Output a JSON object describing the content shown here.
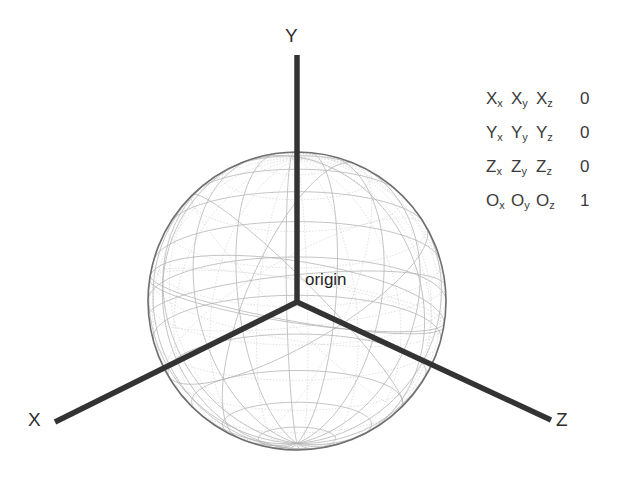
{
  "diagram": {
    "background_color": "#ffffff",
    "axis_color": "#333333",
    "wireframe_color": "#b9b9b9",
    "text_color": "#2e2e2e",
    "origin_label": "origin",
    "axes": [
      {
        "name": "x-axis",
        "label": "X",
        "direction": "lower-left"
      },
      {
        "name": "y-axis",
        "label": "Y",
        "direction": "up"
      },
      {
        "name": "z-axis",
        "label": "Z",
        "direction": "lower-right"
      }
    ],
    "sphere": {
      "center_x": 297,
      "center_y": 301,
      "radius": 149,
      "latitude_lines": 11,
      "longitude_lines": 18,
      "great_circles": 10
    },
    "matrix": {
      "rows": [
        {
          "c0": "X",
          "s0": "x",
          "c1": "X",
          "s1": "y",
          "c2": "X",
          "s2": "z",
          "num": "0"
        },
        {
          "c0": "Y",
          "s0": "x",
          "c1": "Y",
          "s1": "y",
          "c2": "Y",
          "s2": "z",
          "num": "0"
        },
        {
          "c0": "Z",
          "s0": "x",
          "c1": "Z",
          "s1": "y",
          "c2": "Z",
          "s2": "z",
          "num": "0"
        },
        {
          "c0": "O",
          "s0": "x",
          "c1": "O",
          "s1": "y",
          "c2": "O",
          "s2": "z",
          "num": "1"
        }
      ]
    }
  }
}
